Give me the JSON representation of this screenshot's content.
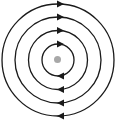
{
  "diagram": {
    "title": "",
    "center": {
      "x": 58,
      "y": 60,
      "radius": 3.5,
      "color": "#a8a8a8"
    },
    "stroke_color": "#1a1a1a",
    "stroke_width": 1.3,
    "direction": "clockwise",
    "orbits": [
      {
        "radius": 16
      },
      {
        "radius": 29.5
      },
      {
        "radius": 43
      },
      {
        "radius": 56
      }
    ]
  }
}
